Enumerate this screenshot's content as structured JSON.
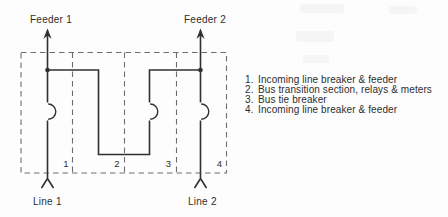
{
  "diagram": {
    "feeder_labels": [
      "Feeder 1",
      "Feeder 2"
    ],
    "line_labels": [
      "Line 1",
      "Line 2"
    ],
    "section_numbers": [
      "1",
      "2",
      "3",
      "4"
    ]
  },
  "legend": {
    "items": [
      {
        "num": "1.",
        "text": "Incoming line breaker & feeder"
      },
      {
        "num": "2.",
        "text": "Bus transition section, relays & meters"
      },
      {
        "num": "3.",
        "text": "Bus tie breaker"
      },
      {
        "num": "4.",
        "text": "Incoming line breaker & feeder"
      }
    ]
  },
  "colors": {
    "line": "#303030",
    "dash": "#6e6e6e",
    "text": "#2e2e2e",
    "background": "#fdfdfd"
  }
}
